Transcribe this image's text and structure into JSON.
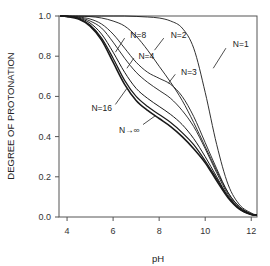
{
  "chart_data": {
    "type": "line",
    "title": "",
    "xlabel": "pH",
    "ylabel": "DEGREE OF PROTONATION",
    "xlim": [
      3.65,
      12.25
    ],
    "ylim": [
      0.0,
      1.0
    ],
    "grid": false,
    "legend": "inline labels",
    "x_ticks": [
      4,
      6,
      8,
      10,
      12
    ],
    "x_tick_labels": [
      "4",
      "6",
      "8",
      "10",
      "12"
    ],
    "y_ticks": [
      0.0,
      0.2,
      0.4,
      0.6,
      0.8,
      1.0
    ],
    "y_tick_labels": [
      "0.0",
      "0.2",
      "0.4",
      "0.6",
      "0.8",
      "1.0"
    ],
    "x": [
      3.7,
      4.0,
      4.5,
      5.0,
      5.5,
      6.0,
      6.5,
      7.0,
      7.5,
      8.0,
      8.5,
      9.0,
      9.5,
      10.0,
      10.5,
      11.0,
      11.5,
      12.0,
      12.25
    ],
    "series": [
      {
        "name": "N=1",
        "values": [
          1.0,
          1.0,
          1.0,
          1.0,
          1.0,
          1.0,
          1.0,
          0.998,
          0.995,
          0.99,
          0.975,
          0.94,
          0.84,
          0.62,
          0.36,
          0.16,
          0.06,
          0.02,
          0.01
        ]
      },
      {
        "name": "N=2",
        "values": [
          1.0,
          1.0,
          0.999,
          0.997,
          0.99,
          0.975,
          0.95,
          0.9,
          0.83,
          0.75,
          0.67,
          0.58,
          0.47,
          0.35,
          0.23,
          0.12,
          0.05,
          0.015,
          0.01
        ]
      },
      {
        "name": "N=3",
        "values": [
          1.0,
          0.999,
          0.995,
          0.985,
          0.96,
          0.91,
          0.84,
          0.77,
          0.72,
          0.69,
          0.66,
          0.6,
          0.5,
          0.37,
          0.24,
          0.12,
          0.05,
          0.015,
          0.01
        ]
      },
      {
        "name": "N=4",
        "values": [
          1.0,
          0.999,
          0.993,
          0.975,
          0.94,
          0.87,
          0.79,
          0.72,
          0.67,
          0.63,
          0.59,
          0.53,
          0.45,
          0.34,
          0.22,
          0.11,
          0.045,
          0.015,
          0.01
        ]
      },
      {
        "name": "N=8",
        "values": [
          1.0,
          0.998,
          0.99,
          0.965,
          0.91,
          0.82,
          0.72,
          0.64,
          0.59,
          0.55,
          0.51,
          0.46,
          0.39,
          0.3,
          0.2,
          0.1,
          0.04,
          0.013,
          0.01
        ]
      },
      {
        "name": "N=16",
        "values": [
          1.0,
          0.998,
          0.987,
          0.955,
          0.89,
          0.79,
          0.68,
          0.6,
          0.55,
          0.51,
          0.47,
          0.42,
          0.36,
          0.28,
          0.19,
          0.1,
          0.04,
          0.012,
          0.01
        ]
      },
      {
        "name": "N→∞",
        "values": [
          1.0,
          0.997,
          0.985,
          0.95,
          0.88,
          0.77,
          0.66,
          0.58,
          0.53,
          0.49,
          0.45,
          0.4,
          0.34,
          0.27,
          0.18,
          0.095,
          0.038,
          0.012,
          0.01
        ]
      }
    ],
    "annotations": [
      {
        "text": "N=1",
        "x": 10.9,
        "y": 0.84
      },
      {
        "text": "N=2",
        "x": 8.2,
        "y": 0.89
      },
      {
        "text": "N=3",
        "x": 8.7,
        "y": 0.71
      },
      {
        "text": "N=4",
        "x": 6.9,
        "y": 0.79
      },
      {
        "text": "N=8",
        "x": 6.5,
        "y": 0.89
      },
      {
        "text": "N=16",
        "x": 6.1,
        "y": 0.56
      },
      {
        "text": "N→∞",
        "x": 7.3,
        "y": 0.46
      }
    ]
  },
  "axes": {
    "xlabel": "pH",
    "ylabel": "DEGREE OF PROTONATION"
  }
}
